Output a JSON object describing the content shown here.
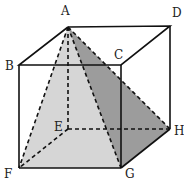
{
  "figure": {
    "type": "cube with inscribed pyramid",
    "vertices": {
      "A": {
        "x": 68,
        "y": 27
      },
      "B": {
        "x": 19,
        "y": 65
      },
      "C": {
        "x": 121,
        "y": 65
      },
      "D": {
        "x": 170,
        "y": 26
      },
      "E": {
        "x": 68,
        "y": 129
      },
      "F": {
        "x": 19,
        "y": 168
      },
      "G": {
        "x": 121,
        "y": 168
      },
      "H": {
        "x": 170,
        "y": 129
      }
    },
    "labels": {
      "A": "A",
      "B": "B",
      "C": "C",
      "D": "D",
      "E": "E",
      "F": "F",
      "G": "G",
      "H": "H"
    },
    "colors": {
      "light_face": "#d9d9d9",
      "dark_face": "#9c9c9c",
      "line": "#111111"
    }
  }
}
